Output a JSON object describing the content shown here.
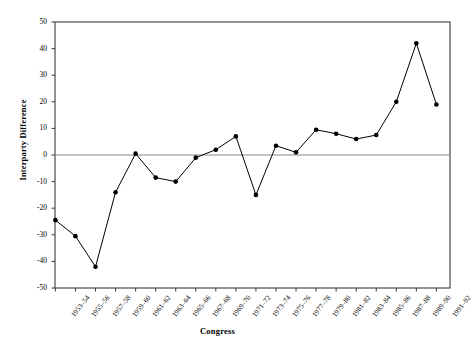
{
  "chart_data": {
    "type": "line",
    "title": "",
    "subtitle": "",
    "xlabel": "Congress",
    "ylabel": "Interparty Difference",
    "ylim": [
      -50,
      50
    ],
    "ytick_step": 10,
    "yticks": [
      50,
      40,
      30,
      20,
      10,
      0,
      -10,
      -20,
      -30,
      -40,
      -50
    ],
    "ytick_labels": [
      "50",
      "40",
      "30",
      "20",
      "10",
      "0",
      "-10",
      "-20",
      "-30",
      "-40",
      "-50"
    ],
    "grid": false,
    "legend": "none",
    "zero_line": true,
    "marker": "filled-circle",
    "line_color": "#000000",
    "marker_color": "#000000",
    "axis_color": "#3a3a3a",
    "background_color": "#ffffff",
    "categories": [
      "1953–54",
      "1955–56",
      "1957–58",
      "1959–60",
      "1961–62",
      "1963–64",
      "1965–66",
      "1967–68",
      "1969–70",
      "1971–72",
      "1973–74",
      "1975–76",
      "1977–78",
      "1979–80",
      "1981–82",
      "1983–84",
      "1985–86",
      "1987–88",
      "1989–90",
      "1991–92"
    ],
    "values": [
      -24.5,
      -30.5,
      -42,
      -14,
      0.5,
      -8.5,
      -10,
      -1,
      2,
      7,
      -15,
      3.5,
      1,
      9.5,
      8,
      6,
      7.5,
      20,
      42,
      19
    ]
  }
}
